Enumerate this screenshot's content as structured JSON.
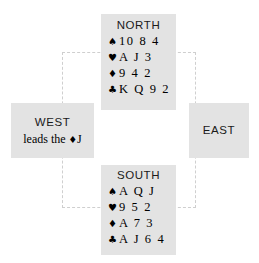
{
  "diagram": {
    "type": "bridge-hand-diagram",
    "colors": {
      "panel_background": "#e3e3e3",
      "page_background": "#ffffff",
      "text": "#000000",
      "table_outline": "#cfcfcf"
    },
    "table_outline": {
      "style": "dashed",
      "visible": true
    }
  },
  "seats": {
    "north": {
      "label": "NORTH",
      "suits": [
        {
          "symbol": "♠",
          "name": "spade-symbol",
          "cards": "10 8 4"
        },
        {
          "symbol": "♥",
          "name": "heart-symbol",
          "cards": "A J 3"
        },
        {
          "symbol": "♦",
          "name": "diamond-symbol",
          "cards": "9 4 2"
        },
        {
          "symbol": "♣",
          "name": "club-symbol",
          "cards": "K Q 9 2"
        }
      ]
    },
    "south": {
      "label": "SOUTH",
      "suits": [
        {
          "symbol": "♠",
          "name": "spade-symbol",
          "cards": "A Q J"
        },
        {
          "symbol": "♥",
          "name": "heart-symbol",
          "cards": "9 5 2"
        },
        {
          "symbol": "♦",
          "name": "diamond-symbol",
          "cards": "A 7 3"
        },
        {
          "symbol": "♣",
          "name": "club-symbol",
          "cards": "A J 6 4"
        }
      ]
    },
    "west": {
      "label": "WEST",
      "lead_prefix": "leads the ",
      "lead_suit_symbol": "♦",
      "lead_rank": "J"
    },
    "east": {
      "label": "EAST"
    }
  }
}
